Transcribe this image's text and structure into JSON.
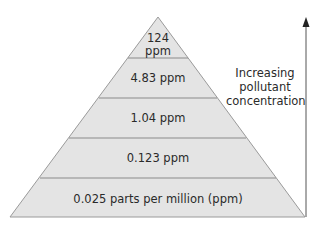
{
  "pyramid": {
    "levels": [
      {
        "top_line1": "124",
        "top_line2": "ppm"
      },
      {
        "label": "4.83 ppm"
      },
      {
        "label": "1.04 ppm"
      },
      {
        "label": "0.123 ppm"
      },
      {
        "label": "0.025 parts per million (ppm)"
      }
    ],
    "fill_color": "#e4e4e4",
    "stroke_color": "#8a8a8a"
  },
  "arrow": {
    "label_line1": "Increasing",
    "label_line2": "pollutant",
    "label_line3": "concentration"
  }
}
